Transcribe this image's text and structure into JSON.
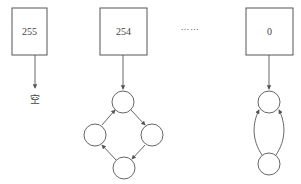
{
  "diagram": {
    "type": "bucket-list-structure",
    "buckets": [
      {
        "label": "255",
        "content": "empty",
        "empty_label": "空"
      },
      {
        "label": "254",
        "content": "cycle-4",
        "nodes": 4
      },
      {
        "label": "0",
        "content": "cycle-2",
        "nodes": 2
      }
    ],
    "ellipsis": "……"
  },
  "colors": {
    "stroke": "#555555",
    "background": "#ffffff",
    "text": "#444444"
  }
}
